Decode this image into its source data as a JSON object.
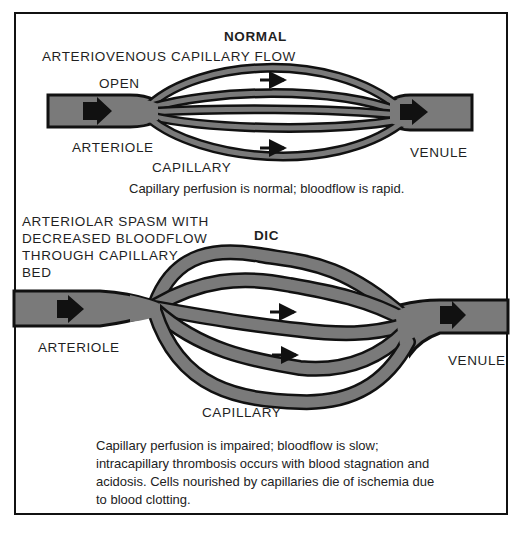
{
  "figure": {
    "normal": {
      "title": "NORMAL",
      "subtitle": "ARTERIOVENOUS CAPILLARY FLOW",
      "labels": {
        "open": "OPEN",
        "arteriole": "ARTERIOLE",
        "capillary": "CAPILLARY",
        "venule": "VENULE"
      },
      "caption": "Capillary perfusion is normal; bloodflow is rapid."
    },
    "dic": {
      "title": "DIC",
      "spasm_label": [
        "ARTERIOLAR SPASM WITH",
        "DECREASED BLOODFLOW",
        "THROUGH CAPILLARY",
        "BED"
      ],
      "labels": {
        "arteriole": "ARTERIOLE",
        "capillary": "CAPILLARY",
        "venule": "VENULE"
      },
      "caption": [
        "Capillary perfusion is impaired; bloodflow is slow;",
        "intracapillary thrombosis occurs with blood stagnation and",
        "acidosis.  Cells nourished by capillaries die of ischemia due",
        "to blood clotting."
      ]
    },
    "colors": {
      "vessel_fill": "#7a7a7a",
      "vessel_outline": "#111111",
      "background": "#ffffff"
    }
  }
}
